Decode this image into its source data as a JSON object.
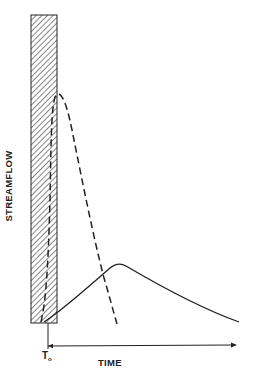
{
  "diagram": {
    "y_axis_label": "STREAMFLOW",
    "x_axis_label": "TIME",
    "origin_label": "T",
    "origin_subscript": "o",
    "colors": {
      "line": "#222222",
      "background": "#ffffff"
    },
    "elements": [
      {
        "id": "rainfall-bar",
        "type": "hatched-rectangle",
        "description": "Tall narrow hatched rectangle spanning full height at time origin"
      },
      {
        "id": "dashed-hydrograph",
        "type": "dashed-curve",
        "description": "Sharp, early, high peak hydrograph"
      },
      {
        "id": "solid-hydrograph",
        "type": "solid-curve",
        "description": "Delayed, lower, broader peak hydrograph"
      },
      {
        "id": "time-axis",
        "type": "arrow",
        "description": "Horizontal time arrow from T0 to the right"
      }
    ]
  }
}
